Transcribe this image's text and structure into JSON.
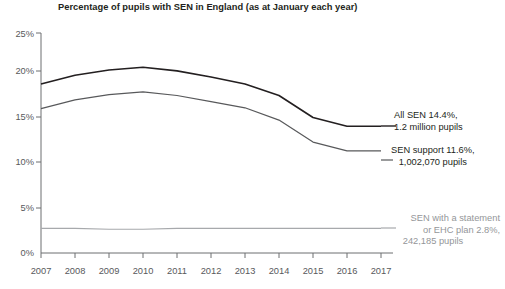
{
  "chart_data": {
    "type": "line",
    "title": "Percentage of pupils with SEN in England (as at January each year)",
    "xlabel": "",
    "ylabel": "",
    "x": [
      2007,
      2008,
      2009,
      2010,
      2011,
      2012,
      2013,
      2014,
      2015,
      2016,
      2017
    ],
    "xtick_labels": [
      "2007",
      "2008",
      "2009",
      "2010",
      "2011",
      "2012",
      "2013",
      "2014",
      "2015",
      "2016",
      "2017"
    ],
    "ytick_labels": [
      "0%",
      "5%",
      "10%",
      "15%",
      "20%",
      "25%"
    ],
    "ytick_values": [
      0,
      5,
      10,
      15,
      20,
      25
    ],
    "ylim": [
      0,
      25
    ],
    "xlim": [
      2007,
      2017
    ],
    "grid": false,
    "legend": "none",
    "series": [
      {
        "name": "All SEN",
        "color": "#231f20",
        "values": [
          19.2,
          20.2,
          20.8,
          21.1,
          20.7,
          20.0,
          19.2,
          17.9,
          15.4,
          14.4,
          14.4
        ]
      },
      {
        "name": "SEN support",
        "color": "#58595b",
        "values": [
          16.4,
          17.4,
          18.0,
          18.3,
          17.9,
          17.2,
          16.5,
          15.1,
          12.6,
          11.6,
          11.6
        ]
      },
      {
        "name": "SEN with a statement or EHC plan",
        "color": "#a7a9ac",
        "values": [
          2.8,
          2.8,
          2.7,
          2.7,
          2.8,
          2.8,
          2.8,
          2.8,
          2.8,
          2.8,
          2.8
        ]
      }
    ],
    "annotations": [
      {
        "id": "all-sen",
        "lines": [
          "All SEN 14.4%,",
          "1.2 million pupils"
        ],
        "color": "#231f20"
      },
      {
        "id": "sen-support",
        "lines": [
          "SEN support 11.6%,",
          "1,002,070 pupils"
        ],
        "color": "#231f20"
      },
      {
        "id": "sen-statement",
        "lines": [
          "SEN with a statement",
          "or EHC plan 2.8%,",
          "242,185 pupils"
        ],
        "color": "#949699"
      }
    ]
  }
}
